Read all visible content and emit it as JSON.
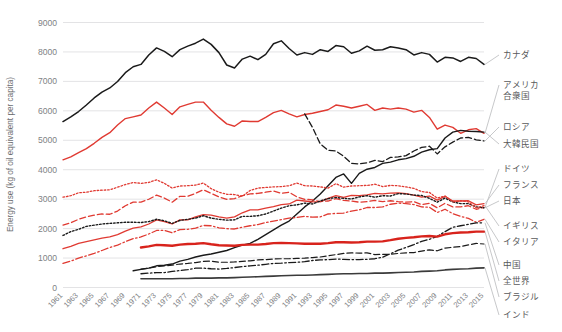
{
  "chart_data": {
    "type": "line",
    "title": "",
    "xlabel": "",
    "ylabel": "Energy use  (kg of oil equivalent per capita)",
    "xlim": [
      1961,
      2015
    ],
    "ylim": [
      0,
      9000
    ],
    "yticks": [
      0,
      1000,
      2000,
      3000,
      4000,
      5000,
      6000,
      7000,
      8000,
      9000
    ],
    "grid": "horizontal",
    "legend_position": "right-outside",
    "x": [
      1961,
      1962,
      1963,
      1964,
      1965,
      1966,
      1967,
      1968,
      1969,
      1970,
      1971,
      1972,
      1973,
      1974,
      1975,
      1976,
      1977,
      1978,
      1979,
      1980,
      1981,
      1982,
      1983,
      1984,
      1985,
      1986,
      1987,
      1988,
      1989,
      1990,
      1991,
      1992,
      1993,
      1994,
      1995,
      1996,
      1997,
      1998,
      1999,
      2000,
      2001,
      2002,
      2003,
      2004,
      2005,
      2006,
      2007,
      2008,
      2009,
      2010,
      2011,
      2012,
      2013,
      2014,
      2015
    ],
    "xticks": [
      1961,
      1963,
      1965,
      1967,
      1969,
      1971,
      1973,
      1975,
      1977,
      1979,
      1981,
      1983,
      1985,
      1987,
      1989,
      1991,
      1993,
      1995,
      1997,
      1999,
      2001,
      2003,
      2005,
      2007,
      2009,
      2011,
      2013,
      2015
    ],
    "series": [
      {
        "name": "カナダ",
        "color": "#1a1a1a",
        "style": "solid",
        "width": 1.5,
        "label_y": 58,
        "values": [
          5620,
          5780,
          5960,
          6180,
          6420,
          6620,
          6760,
          6980,
          7280,
          7480,
          7560,
          7880,
          8120,
          8000,
          7820,
          8060,
          8180,
          8280,
          8420,
          8240,
          7960,
          7540,
          7440,
          7740,
          7840,
          7720,
          7900,
          8260,
          8360,
          8100,
          7880,
          7960,
          7900,
          8060,
          8000,
          8200,
          8160,
          7940,
          8020,
          8180,
          8040,
          8060,
          8160,
          8120,
          8060,
          7880,
          7960,
          7900,
          7640,
          7800,
          7780,
          7660,
          7800,
          7760,
          7560
        ],
        "has_data_from": 1961
      },
      {
        "name": "アメリカ\n合衆国",
        "color": "#e03a32",
        "style": "solid",
        "width": 1.4,
        "label_y": 88,
        "values": [
          4320,
          4420,
          4560,
          4700,
          4880,
          5080,
          5240,
          5500,
          5720,
          5780,
          5840,
          6080,
          6280,
          6080,
          5860,
          6120,
          6200,
          6280,
          6280,
          6000,
          5760,
          5540,
          5460,
          5640,
          5620,
          5620,
          5760,
          5920,
          6000,
          5880,
          5780,
          5860,
          5900,
          5960,
          6020,
          6180,
          6140,
          6080,
          6140,
          6200,
          6000,
          6080,
          6040,
          6080,
          6040,
          5940,
          6000,
          5760,
          5360,
          5500,
          5420,
          5220,
          5340,
          5380,
          5220
        ],
        "has_data_from": 1961
      },
      {
        "name": "ロシア",
        "color": "#1a1a1a",
        "style": "dashed",
        "width": 1.3,
        "label_y": 130,
        "values": [
          null,
          null,
          null,
          null,
          null,
          null,
          null,
          null,
          null,
          null,
          null,
          null,
          null,
          null,
          null,
          null,
          null,
          null,
          null,
          null,
          null,
          null,
          null,
          null,
          null,
          null,
          null,
          null,
          null,
          null,
          null,
          5880,
          5420,
          4860,
          4640,
          4620,
          4440,
          4200,
          4180,
          4220,
          4300,
          4260,
          4400,
          4420,
          4460,
          4620,
          4740,
          4780,
          4520,
          4760,
          4920,
          5060,
          5080,
          5000,
          4960
        ],
        "has_data_from": 1992
      },
      {
        "name": "大韓民国",
        "color": "#1a1a1a",
        "style": "solid",
        "width": 1.4,
        "label_y": 147,
        "values": [
          null,
          null,
          null,
          null,
          null,
          null,
          null,
          null,
          null,
          550,
          600,
          640,
          720,
          740,
          780,
          880,
          940,
          1020,
          1080,
          1120,
          1180,
          1240,
          1340,
          1420,
          1480,
          1620,
          1780,
          1940,
          2100,
          2240,
          2480,
          2720,
          2920,
          3160,
          3440,
          3720,
          3840,
          3520,
          3860,
          4000,
          4060,
          4200,
          4240,
          4320,
          4360,
          4440,
          4580,
          4660,
          4700,
          5060,
          5260,
          5320,
          5290,
          5280,
          5260
        ],
        "has_data_from": 1971
      },
      {
        "name": "ドイツ",
        "color": "#e03a32",
        "style": "dashed",
        "width": 1.3,
        "label_y": 172,
        "values": [
          2100,
          2180,
          2300,
          2380,
          2440,
          2480,
          2470,
          2580,
          2760,
          2880,
          2880,
          2980,
          3120,
          3020,
          2880,
          3080,
          3080,
          3180,
          3300,
          3180,
          3060,
          2980,
          3000,
          3100,
          3160,
          3180,
          3220,
          3260,
          3180,
          3220,
          3060,
          2980,
          2960,
          2900,
          2920,
          3000,
          2940,
          2920,
          2880,
          2900,
          2940,
          2900,
          2930,
          2900,
          2880,
          2900,
          2800,
          2840,
          2690,
          2840,
          2720,
          2720,
          2760,
          2640,
          2700
        ],
        "has_data_from": 1961
      },
      {
        "name": "フランス",
        "color": "#e03a32",
        "style": "solid",
        "width": 1.3,
        "label_y": 188,
        "values": [
          1300,
          1380,
          1480,
          1540,
          1600,
          1660,
          1700,
          1780,
          1900,
          2000,
          2040,
          2140,
          2280,
          2220,
          2140,
          2280,
          2280,
          2380,
          2460,
          2440,
          2380,
          2340,
          2380,
          2520,
          2620,
          2620,
          2680,
          2730,
          2800,
          2820,
          2950,
          2920,
          2890,
          2900,
          3010,
          3100,
          3040,
          3110,
          3100,
          3130,
          3180,
          3160,
          3190,
          3200,
          3170,
          3120,
          3050,
          3090,
          2950,
          3080,
          2920,
          2920,
          2930,
          2790,
          2830
        ],
        "has_data_from": 1961
      },
      {
        "name": "日本",
        "color": "#1a1a1a",
        "style": "dotted",
        "width": 1.4,
        "label_y": 204,
        "values": [
          1750,
          1880,
          1960,
          2060,
          2100,
          2140,
          2160,
          2180,
          2200,
          2200,
          2190,
          2220,
          2300,
          2250,
          2160,
          2260,
          2300,
          2340,
          2420,
          2340,
          2300,
          2270,
          2280,
          2400,
          2400,
          2420,
          2480,
          2580,
          2680,
          2760,
          2790,
          2850,
          2820,
          2920,
          3000,
          3040,
          3010,
          2990,
          3060,
          3100,
          3050,
          3100,
          3090,
          3170,
          3160,
          3120,
          3110,
          3010,
          2880,
          3020,
          2890,
          2830,
          2830,
          2720,
          2690
        ],
        "has_data_from": 1961
      },
      {
        "name": "イギリス",
        "color": "#e03a32",
        "style": "dotted",
        "width": 1.3,
        "label_y": 229,
        "values": [
          3050,
          3100,
          3200,
          3220,
          3270,
          3290,
          3300,
          3390,
          3480,
          3550,
          3520,
          3550,
          3640,
          3520,
          3360,
          3430,
          3440,
          3460,
          3530,
          3340,
          3220,
          3150,
          3140,
          3080,
          3280,
          3360,
          3380,
          3400,
          3410,
          3440,
          3530,
          3440,
          3430,
          3400,
          3360,
          3510,
          3390,
          3430,
          3440,
          3450,
          3490,
          3410,
          3450,
          3440,
          3400,
          3350,
          3240,
          3210,
          3020,
          3090,
          2890,
          2930,
          2890,
          2690,
          2760
        ],
        "has_data_from": 1961
      },
      {
        "name": "イタリア",
        "color": "#e03a32",
        "style": "dashdot",
        "width": 1.3,
        "label_y": 245,
        "values": [
          800,
          880,
          980,
          1060,
          1140,
          1240,
          1340,
          1420,
          1540,
          1640,
          1700,
          1800,
          1920,
          1920,
          1840,
          1950,
          1960,
          2000,
          2090,
          2080,
          2010,
          1980,
          1970,
          2030,
          2080,
          2120,
          2190,
          2240,
          2290,
          2340,
          2360,
          2400,
          2370,
          2380,
          2480,
          2500,
          2510,
          2580,
          2620,
          2700,
          2700,
          2720,
          2810,
          2850,
          2830,
          2800,
          2720,
          2710,
          2530,
          2640,
          2490,
          2400,
          2330,
          2200,
          2300
        ],
        "has_data_from": 1961
      },
      {
        "name": "中国",
        "color": "#1a1a1a",
        "style": "dashdot",
        "width": 1.3,
        "label_y": 268,
        "values": [
          null,
          null,
          null,
          null,
          null,
          null,
          null,
          null,
          null,
          null,
          450,
          470,
          490,
          490,
          530,
          560,
          590,
          640,
          640,
          620,
          610,
          630,
          660,
          690,
          720,
          740,
          770,
          800,
          810,
          830,
          840,
          860,
          900,
          920,
          930,
          950,
          940,
          930,
          930,
          940,
          960,
          1010,
          1130,
          1250,
          1340,
          1440,
          1550,
          1620,
          1720,
          1880,
          2030,
          2080,
          2130,
          2180,
          2180
        ],
        "has_data_from": 1971
      },
      {
        "name": "全世界",
        "color": "#d8231c",
        "style": "solid",
        "width": 2.4,
        "label_y": 284,
        "values": [
          null,
          null,
          null,
          null,
          null,
          null,
          null,
          null,
          null,
          null,
          1340,
          1380,
          1430,
          1420,
          1400,
          1440,
          1460,
          1470,
          1490,
          1450,
          1420,
          1410,
          1400,
          1430,
          1440,
          1440,
          1460,
          1490,
          1500,
          1490,
          1480,
          1470,
          1470,
          1470,
          1490,
          1520,
          1520,
          1510,
          1520,
          1540,
          1540,
          1550,
          1590,
          1640,
          1670,
          1690,
          1720,
          1730,
          1710,
          1790,
          1830,
          1850,
          1860,
          1880,
          1880
        ],
        "has_data_from": 1971
      },
      {
        "name": "ブラジル",
        "color": "#1a1a1a",
        "style": "dashed",
        "width": 1.2,
        "label_y": 300,
        "values": [
          null,
          null,
          null,
          null,
          null,
          null,
          null,
          null,
          null,
          null,
          610,
          640,
          690,
          720,
          740,
          780,
          800,
          830,
          870,
          880,
          840,
          840,
          850,
          870,
          890,
          920,
          930,
          950,
          960,
          960,
          970,
          980,
          1000,
          1020,
          1060,
          1100,
          1140,
          1160,
          1150,
          1160,
          1100,
          1110,
          1110,
          1140,
          1160,
          1170,
          1220,
          1260,
          1230,
          1320,
          1350,
          1370,
          1430,
          1480,
          1460
        ],
        "has_data_from": 1971
      },
      {
        "name": "インド",
        "color": "#3b3b3b",
        "style": "solid",
        "width": 1.6,
        "label_y": 318,
        "values": [
          null,
          null,
          null,
          null,
          null,
          null,
          null,
          null,
          null,
          null,
          280,
          280,
          280,
          280,
          280,
          290,
          290,
          300,
          300,
          300,
          310,
          310,
          320,
          330,
          340,
          350,
          360,
          370,
          380,
          390,
          400,
          400,
          410,
          420,
          430,
          440,
          450,
          450,
          460,
          460,
          470,
          470,
          480,
          490,
          500,
          510,
          530,
          540,
          550,
          580,
          600,
          610,
          620,
          640,
          650
        ],
        "has_data_from": 1971
      }
    ]
  }
}
